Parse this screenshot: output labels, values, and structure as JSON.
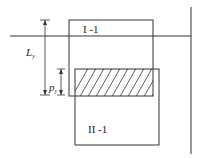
{
  "diagram": {
    "boxes": [
      {
        "id": "box-I-1",
        "label": "I -1"
      },
      {
        "id": "box-II-1",
        "label": "II -1"
      }
    ],
    "dimensions": {
      "Ly": {
        "main": "L",
        "sub": "y"
      },
      "py": {
        "main": "p",
        "sub": "y"
      }
    },
    "colors": {
      "line": "#333333",
      "hatch": "#333333",
      "background": "#ffffff"
    }
  }
}
